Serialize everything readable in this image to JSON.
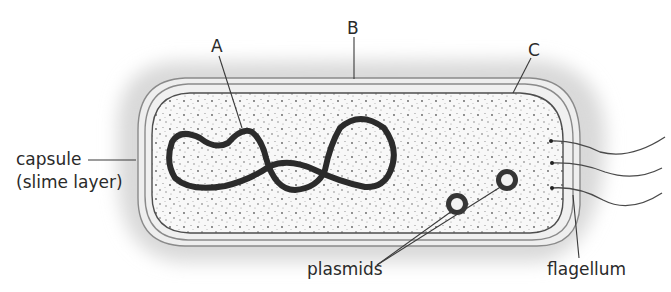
{
  "diagram": {
    "labels": {
      "A": "A",
      "B": "B",
      "C": "C",
      "capsule_line1": "capsule",
      "capsule_line2": "(slime layer)",
      "plasmids": "plasmids",
      "flagellum": "flagellum"
    },
    "parts": [
      {
        "id": "A",
        "meaning": "chromosomal DNA loop"
      },
      {
        "id": "B",
        "meaning": "cell wall"
      },
      {
        "id": "C",
        "meaning": "cell membrane"
      }
    ],
    "plasmid_count": 2,
    "flagella_count": 3,
    "colors": {
      "halo": "#dcdcdc",
      "outline": "#7a7a7a",
      "membrane": "#555555",
      "dna": "#2b2b2b",
      "cytoplasm": "#f7f7f7",
      "stipple": "#6a6a6a",
      "text": "#2a2a2a"
    }
  }
}
